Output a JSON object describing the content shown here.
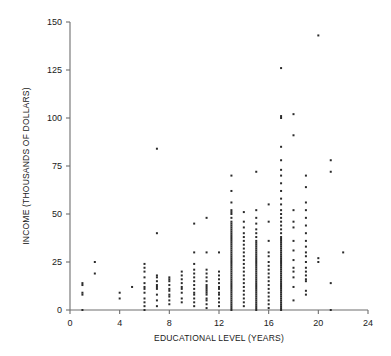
{
  "chart_data": {
    "type": "scatter",
    "title": "",
    "xlabel": "EDUCATIONAL LEVEL (YEARS)",
    "ylabel": "INCOME (THOUSANDS OF DOLLARS)",
    "xlim": [
      0,
      24
    ],
    "ylim": [
      0,
      150
    ],
    "xticks": [
      0,
      4,
      8,
      12,
      16,
      20,
      24
    ],
    "yticks": [
      0,
      25,
      50,
      75,
      100,
      125,
      150
    ],
    "xtick_labels": [
      "0",
      "4",
      "8",
      "12",
      "16",
      "20",
      "24"
    ],
    "ytick_labels": [
      "0",
      "25",
      "50",
      "75",
      "100",
      "125",
      "150"
    ],
    "grid": false,
    "legend": null,
    "marker": "square",
    "marker_color": "#2b2b2b",
    "marker_size": 2,
    "points": [
      [
        1,
        0
      ],
      [
        1,
        8
      ],
      [
        1,
        9
      ],
      [
        1,
        13
      ],
      [
        1,
        14
      ],
      [
        2,
        19
      ],
      [
        2,
        25
      ],
      [
        4,
        6
      ],
      [
        4,
        9
      ],
      [
        5,
        12
      ],
      [
        6,
        0
      ],
      [
        6,
        2
      ],
      [
        6,
        4
      ],
      [
        6,
        6
      ],
      [
        6,
        9
      ],
      [
        6,
        11
      ],
      [
        6,
        12
      ],
      [
        6,
        14
      ],
      [
        6,
        17
      ],
      [
        6,
        20
      ],
      [
        6,
        22
      ],
      [
        6,
        24
      ],
      [
        7,
        2
      ],
      [
        7,
        5
      ],
      [
        7,
        8
      ],
      [
        7,
        11
      ],
      [
        7,
        12
      ],
      [
        7,
        13
      ],
      [
        7,
        15
      ],
      [
        7,
        17
      ],
      [
        7,
        18
      ],
      [
        7,
        40
      ],
      [
        7,
        84
      ],
      [
        8,
        3
      ],
      [
        8,
        5
      ],
      [
        8,
        7
      ],
      [
        8,
        8
      ],
      [
        8,
        10
      ],
      [
        8,
        11
      ],
      [
        8,
        13
      ],
      [
        8,
        15
      ],
      [
        8,
        16
      ],
      [
        8,
        17
      ],
      [
        9,
        4
      ],
      [
        9,
        6
      ],
      [
        9,
        9
      ],
      [
        9,
        11
      ],
      [
        9,
        12
      ],
      [
        9,
        14
      ],
      [
        9,
        16
      ],
      [
        9,
        18
      ],
      [
        9,
        20
      ],
      [
        10,
        2
      ],
      [
        10,
        4
      ],
      [
        10,
        6
      ],
      [
        10,
        8
      ],
      [
        10,
        9
      ],
      [
        10,
        11
      ],
      [
        10,
        13
      ],
      [
        10,
        15
      ],
      [
        10,
        17
      ],
      [
        10,
        19
      ],
      [
        10,
        21
      ],
      [
        10,
        24
      ],
      [
        10,
        30
      ],
      [
        10,
        45
      ],
      [
        11,
        1
      ],
      [
        11,
        3
      ],
      [
        11,
        5
      ],
      [
        11,
        6
      ],
      [
        11,
        8
      ],
      [
        11,
        9
      ],
      [
        11,
        10
      ],
      [
        11,
        11
      ],
      [
        11,
        12
      ],
      [
        11,
        13
      ],
      [
        11,
        15
      ],
      [
        11,
        17
      ],
      [
        11,
        19
      ],
      [
        11,
        21
      ],
      [
        11,
        30
      ],
      [
        11,
        48
      ],
      [
        12,
        2
      ],
      [
        12,
        4
      ],
      [
        12,
        6
      ],
      [
        12,
        8
      ],
      [
        12,
        9
      ],
      [
        12,
        11
      ],
      [
        12,
        12
      ],
      [
        12,
        14
      ],
      [
        12,
        16
      ],
      [
        12,
        18
      ],
      [
        12,
        20
      ],
      [
        12,
        30
      ],
      [
        13,
        0
      ],
      [
        13,
        1
      ],
      [
        13,
        2
      ],
      [
        13,
        3
      ],
      [
        13,
        4
      ],
      [
        13,
        5
      ],
      [
        13,
        6
      ],
      [
        13,
        7
      ],
      [
        13,
        8
      ],
      [
        13,
        9
      ],
      [
        13,
        10
      ],
      [
        13,
        11
      ],
      [
        13,
        12
      ],
      [
        13,
        13
      ],
      [
        13,
        14
      ],
      [
        13,
        15
      ],
      [
        13,
        16
      ],
      [
        13,
        17
      ],
      [
        13,
        18
      ],
      [
        13,
        19
      ],
      [
        13,
        20
      ],
      [
        13,
        21
      ],
      [
        13,
        22
      ],
      [
        13,
        23
      ],
      [
        13,
        24
      ],
      [
        13,
        25
      ],
      [
        13,
        26
      ],
      [
        13,
        27
      ],
      [
        13,
        28
      ],
      [
        13,
        29
      ],
      [
        13,
        30
      ],
      [
        13,
        31
      ],
      [
        13,
        32
      ],
      [
        13,
        33
      ],
      [
        13,
        34
      ],
      [
        13,
        35
      ],
      [
        13,
        36
      ],
      [
        13,
        37
      ],
      [
        13,
        38
      ],
      [
        13,
        39
      ],
      [
        13,
        40
      ],
      [
        13,
        41
      ],
      [
        13,
        42
      ],
      [
        13,
        43
      ],
      [
        13,
        44
      ],
      [
        13,
        45
      ],
      [
        13,
        46
      ],
      [
        13,
        48
      ],
      [
        13,
        50
      ],
      [
        13,
        51
      ],
      [
        13,
        52
      ],
      [
        13,
        56
      ],
      [
        13,
        62
      ],
      [
        13,
        70
      ],
      [
        14,
        2
      ],
      [
        14,
        4
      ],
      [
        14,
        6
      ],
      [
        14,
        8
      ],
      [
        14,
        10
      ],
      [
        14,
        12
      ],
      [
        14,
        14
      ],
      [
        14,
        16
      ],
      [
        14,
        18
      ],
      [
        14,
        20
      ],
      [
        14,
        22
      ],
      [
        14,
        24
      ],
      [
        14,
        26
      ],
      [
        14,
        28
      ],
      [
        14,
        30
      ],
      [
        14,
        32
      ],
      [
        14,
        34
      ],
      [
        14,
        36
      ],
      [
        14,
        38
      ],
      [
        14,
        40
      ],
      [
        14,
        43
      ],
      [
        14,
        46
      ],
      [
        14,
        51
      ],
      [
        15,
        0
      ],
      [
        15,
        1
      ],
      [
        15,
        2
      ],
      [
        15,
        3
      ],
      [
        15,
        4
      ],
      [
        15,
        5
      ],
      [
        15,
        6
      ],
      [
        15,
        7
      ],
      [
        15,
        8
      ],
      [
        15,
        9
      ],
      [
        15,
        10
      ],
      [
        15,
        11
      ],
      [
        15,
        12
      ],
      [
        15,
        13
      ],
      [
        15,
        14
      ],
      [
        15,
        15
      ],
      [
        15,
        16
      ],
      [
        15,
        17
      ],
      [
        15,
        18
      ],
      [
        15,
        19
      ],
      [
        15,
        20
      ],
      [
        15,
        21
      ],
      [
        15,
        22
      ],
      [
        15,
        23
      ],
      [
        15,
        24
      ],
      [
        15,
        25
      ],
      [
        15,
        26
      ],
      [
        15,
        27
      ],
      [
        15,
        28
      ],
      [
        15,
        29
      ],
      [
        15,
        30
      ],
      [
        15,
        31
      ],
      [
        15,
        32
      ],
      [
        15,
        33
      ],
      [
        15,
        34
      ],
      [
        15,
        35
      ],
      [
        15,
        36
      ],
      [
        15,
        38
      ],
      [
        15,
        40
      ],
      [
        15,
        42
      ],
      [
        15,
        45
      ],
      [
        15,
        48
      ],
      [
        15,
        52
      ],
      [
        15,
        72
      ],
      [
        16,
        1
      ],
      [
        16,
        3
      ],
      [
        16,
        5
      ],
      [
        16,
        7
      ],
      [
        16,
        9
      ],
      [
        16,
        11
      ],
      [
        16,
        13
      ],
      [
        16,
        15
      ],
      [
        16,
        17
      ],
      [
        16,
        19
      ],
      [
        16,
        21
      ],
      [
        16,
        23
      ],
      [
        16,
        25
      ],
      [
        16,
        28
      ],
      [
        16,
        30
      ],
      [
        16,
        36
      ],
      [
        16,
        46
      ],
      [
        16,
        55
      ],
      [
        17,
        0
      ],
      [
        17,
        1
      ],
      [
        17,
        2
      ],
      [
        17,
        3
      ],
      [
        17,
        4
      ],
      [
        17,
        5
      ],
      [
        17,
        6
      ],
      [
        17,
        7
      ],
      [
        17,
        8
      ],
      [
        17,
        9
      ],
      [
        17,
        10
      ],
      [
        17,
        11
      ],
      [
        17,
        12
      ],
      [
        17,
        13
      ],
      [
        17,
        14
      ],
      [
        17,
        15
      ],
      [
        17,
        16
      ],
      [
        17,
        17
      ],
      [
        17,
        18
      ],
      [
        17,
        19
      ],
      [
        17,
        20
      ],
      [
        17,
        21
      ],
      [
        17,
        22
      ],
      [
        17,
        23
      ],
      [
        17,
        24
      ],
      [
        17,
        25
      ],
      [
        17,
        26
      ],
      [
        17,
        27
      ],
      [
        17,
        28
      ],
      [
        17,
        29
      ],
      [
        17,
        30
      ],
      [
        17,
        31
      ],
      [
        17,
        32
      ],
      [
        17,
        33
      ],
      [
        17,
        34
      ],
      [
        17,
        35
      ],
      [
        17,
        36
      ],
      [
        17,
        37
      ],
      [
        17,
        38
      ],
      [
        17,
        40
      ],
      [
        17,
        42
      ],
      [
        17,
        44
      ],
      [
        17,
        46
      ],
      [
        17,
        48
      ],
      [
        17,
        50
      ],
      [
        17,
        52
      ],
      [
        17,
        55
      ],
      [
        17,
        58
      ],
      [
        17,
        62
      ],
      [
        17,
        66
      ],
      [
        17,
        70
      ],
      [
        17,
        73
      ],
      [
        17,
        78
      ],
      [
        17,
        85
      ],
      [
        17,
        100
      ],
      [
        17,
        101
      ],
      [
        17,
        126
      ],
      [
        18,
        5
      ],
      [
        18,
        12
      ],
      [
        18,
        17
      ],
      [
        18,
        20
      ],
      [
        18,
        22
      ],
      [
        18,
        26
      ],
      [
        18,
        31
      ],
      [
        18,
        36
      ],
      [
        18,
        43
      ],
      [
        18,
        46
      ],
      [
        18,
        52
      ],
      [
        18,
        91
      ],
      [
        18,
        102
      ],
      [
        19,
        8
      ],
      [
        19,
        10
      ],
      [
        19,
        15
      ],
      [
        19,
        16
      ],
      [
        19,
        18
      ],
      [
        19,
        20
      ],
      [
        19,
        22
      ],
      [
        19,
        25
      ],
      [
        19,
        28
      ],
      [
        19,
        30
      ],
      [
        19,
        33
      ],
      [
        19,
        36
      ],
      [
        19,
        40
      ],
      [
        19,
        44
      ],
      [
        19,
        48
      ],
      [
        19,
        52
      ],
      [
        19,
        56
      ],
      [
        19,
        64
      ],
      [
        19,
        70
      ],
      [
        20,
        25
      ],
      [
        20,
        27
      ],
      [
        20,
        143
      ],
      [
        21,
        0
      ],
      [
        21,
        14
      ],
      [
        21,
        72
      ],
      [
        21,
        78
      ],
      [
        22,
        30
      ]
    ]
  },
  "axes": {
    "x_axis_name": "x-axis",
    "y_axis_name": "y-axis"
  }
}
